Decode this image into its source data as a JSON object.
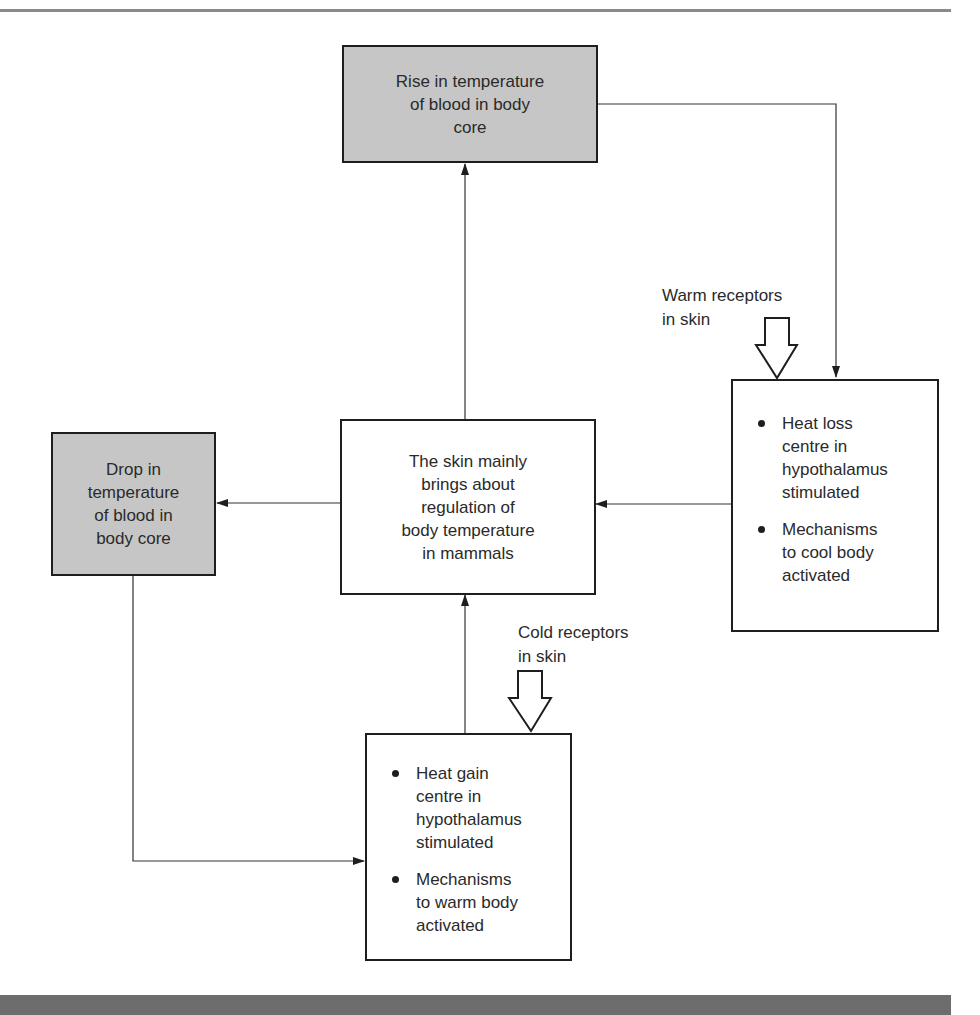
{
  "diagram": {
    "type": "flowchart",
    "topic": "Thermoregulation by the skin in mammals",
    "nodes": {
      "rise": {
        "lines": [
          "Rise in temperature",
          "of blood in body",
          "core"
        ],
        "fill": "#c6c6c6"
      },
      "drop": {
        "lines": [
          "Drop in",
          "temperature",
          "of blood in",
          "body core"
        ],
        "fill": "#c6c6c6"
      },
      "skin": {
        "lines": [
          "The skin mainly",
          "brings about",
          "regulation of",
          "body temperature",
          "in mammals"
        ],
        "fill": "#ffffff"
      },
      "heat_loss": {
        "bullets": [
          {
            "lines": [
              "Heat loss",
              "centre in",
              "hypothalamus",
              "stimulated"
            ]
          },
          {
            "lines": [
              "Mechanisms",
              "to cool body",
              "activated"
            ]
          }
        ],
        "fill": "#ffffff"
      },
      "heat_gain": {
        "bullets": [
          {
            "lines": [
              "Heat gain",
              "centre in",
              "hypothalamus",
              "stimulated"
            ]
          },
          {
            "lines": [
              "Mechanisms",
              "to warm body",
              "activated"
            ]
          }
        ],
        "fill": "#ffffff"
      }
    },
    "labels": {
      "warm": [
        "Warm receptors",
        "in skin"
      ],
      "cold": [
        "Cold receptors",
        "in skin"
      ]
    },
    "edges": [
      {
        "from": "rise",
        "to": "heat_loss"
      },
      {
        "from": "heat_loss",
        "to": "skin"
      },
      {
        "from": "skin",
        "to": "rise"
      },
      {
        "from": "skin",
        "to": "drop"
      },
      {
        "from": "drop",
        "to": "heat_gain"
      },
      {
        "from": "heat_gain",
        "to": "skin"
      },
      {
        "from": "warm_receptors",
        "to": "heat_loss",
        "style": "hollow-arrow"
      },
      {
        "from": "cold_receptors",
        "to": "heat_gain",
        "style": "hollow-arrow"
      }
    ],
    "colors": {
      "shaded_box": "#c6c6c6",
      "border": "#1e1e1e",
      "rule": "#8a8a8a",
      "bottom_band": "#6d6d6d"
    }
  }
}
